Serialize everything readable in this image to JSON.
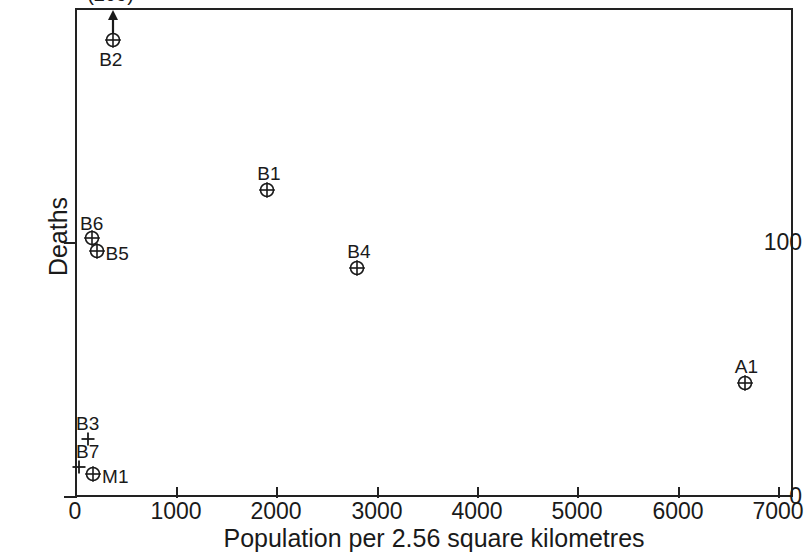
{
  "chart_data": {
    "type": "scatter",
    "title": "",
    "xlabel": "Population per 2.56 square kilometres",
    "ylabel": "Deaths",
    "xlim": [
      0,
      7160
    ],
    "ylim": [
      0,
      193
    ],
    "grid": false,
    "legend": "none",
    "xticks": [
      0,
      1000,
      2000,
      3000,
      4000,
      5000,
      6000,
      7000
    ],
    "xticklabels": [
      "0",
      "1000",
      "2000",
      "3000",
      "4000",
      "5000",
      "6000",
      "7000"
    ],
    "yticks": [
      0,
      100
    ],
    "yticklabels": [
      "0",
      "100"
    ],
    "points": [
      {
        "label": "B2",
        "x": 380,
        "y": 180,
        "marker": "circle-plus",
        "label_pos": "below",
        "annotation": "(209)",
        "arrow": "up"
      },
      {
        "label": "B1",
        "x": 1915,
        "y": 121,
        "marker": "circle-plus",
        "label_pos": "above"
      },
      {
        "label": "B6",
        "x": 170,
        "y": 102,
        "marker": "circle-plus",
        "label_pos": "above"
      },
      {
        "label": "B5",
        "x": 215,
        "y": 97,
        "marker": "circle-plus",
        "label_pos": "right"
      },
      {
        "label": "B4",
        "x": 2810,
        "y": 90,
        "marker": "circle-plus",
        "label_pos": "above"
      },
      {
        "label": "A1",
        "x": 6670,
        "y": 45,
        "marker": "circle-plus",
        "label_pos": "above"
      },
      {
        "label": "B3",
        "x": 130,
        "y": 23,
        "marker": "plus",
        "label_pos": "above"
      },
      {
        "label": "B7",
        "x": 40,
        "y": 12,
        "marker": "plus",
        "label_pos": "above"
      },
      {
        "label": "M1",
        "x": 180,
        "y": 9,
        "marker": "circle-plus",
        "label_pos": "right"
      }
    ]
  },
  "axes": {
    "x_title": "Population per 2.56 square kilometres",
    "y_title": "Deaths",
    "x_tick_labels": [
      "0",
      "1000",
      "2000",
      "3000",
      "4000",
      "5000",
      "6000",
      "7000"
    ],
    "y_tick_labels": [
      "100",
      "0"
    ]
  },
  "points": {
    "p0": {
      "label": "B2",
      "annotation": "(209)"
    },
    "p1": {
      "label": "B1"
    },
    "p2": {
      "label": "B6"
    },
    "p3": {
      "label": "B5"
    },
    "p4": {
      "label": "B4"
    },
    "p5": {
      "label": "A1"
    },
    "p6": {
      "label": "B3"
    },
    "p7": {
      "label": "B7"
    },
    "p8": {
      "label": "M1"
    }
  },
  "colors": {
    "ink": "#1a1a1a",
    "axis": "#222222",
    "background": "#ffffff"
  }
}
